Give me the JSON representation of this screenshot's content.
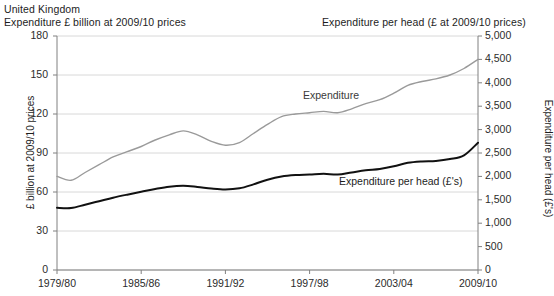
{
  "header": {
    "country": "United Kingdom",
    "left_title": "Expenditure £ billion at 2009/10 prices",
    "right_title": "Expenditure per head (£ at 2009/10 prices)"
  },
  "axes": {
    "left_axis_title": "£ billion at 2009/10 prices",
    "right_axis_title": "Expenditure per head (£'s)",
    "left_ticks": [
      "180",
      "150",
      "120",
      "90",
      "60",
      "30",
      "0"
    ],
    "right_ticks": [
      "5,000",
      "4,500",
      "4,000",
      "3,500",
      "3,000",
      "2,500",
      "2,000",
      "1,500",
      "1,000",
      "500",
      "0"
    ],
    "x_ticks": [
      "1979/80",
      "1985/86",
      "1991/92",
      "1997/98",
      "2003/04",
      "2009/10"
    ]
  },
  "series_labels": {
    "expenditure": "Expenditure",
    "per_head": "Expenditure per head (£'s)"
  },
  "colors": {
    "expenditure_line": "#9a9a9a",
    "per_head_line": "#111111",
    "gridline": "#d8d8d8",
    "axis": "#808080",
    "text": "#2b2b2b",
    "background": "#ffffff"
  },
  "chart_data": {
    "type": "line",
    "title": "United Kingdom Expenditure £ billion at 2009/10 prices",
    "xlabel": "",
    "ylabel": "£ billion at 2009/10 prices",
    "y2label": "Expenditure per head (£'s)",
    "ylim": [
      0,
      180
    ],
    "y2lim": [
      0,
      5000
    ],
    "ytick_step": 30,
    "y2tick_step": 500,
    "grid": true,
    "legend": "inline-annotations",
    "x": [
      "1979/80",
      "1980/81",
      "1981/82",
      "1982/83",
      "1983/84",
      "1984/85",
      "1985/86",
      "1986/87",
      "1987/88",
      "1988/89",
      "1989/90",
      "1990/91",
      "1991/92",
      "1992/93",
      "1993/94",
      "1994/95",
      "1995/96",
      "1996/97",
      "1997/98",
      "1998/99",
      "1999/00",
      "2000/01",
      "2001/02",
      "2002/03",
      "2003/04",
      "2004/05",
      "2005/06",
      "2006/07",
      "2007/08",
      "2008/09",
      "2009/10"
    ],
    "series": [
      {
        "name": "Expenditure",
        "axis": "left",
        "unit": "£ billion at 2009/10 prices",
        "color": "#9a9a9a",
        "values": [
          72,
          69,
          75,
          81,
          87,
          91,
          95,
          100,
          104,
          107,
          104,
          99,
          96,
          98,
          105,
          112,
          118,
          120,
          121,
          122,
          121,
          124,
          128,
          131,
          136,
          142,
          145,
          147,
          150,
          155,
          162
        ]
      },
      {
        "name": "Expenditure per head (£'s)",
        "axis": "right",
        "unit": "£ at 2009/10 prices",
        "color": "#111111",
        "values": [
          1330,
          1325,
          1395,
          1470,
          1545,
          1610,
          1670,
          1730,
          1780,
          1800,
          1775,
          1740,
          1720,
          1745,
          1830,
          1930,
          2000,
          2030,
          2040,
          2055,
          2040,
          2085,
          2130,
          2160,
          2215,
          2290,
          2320,
          2330,
          2370,
          2450,
          2720
        ]
      }
    ]
  }
}
